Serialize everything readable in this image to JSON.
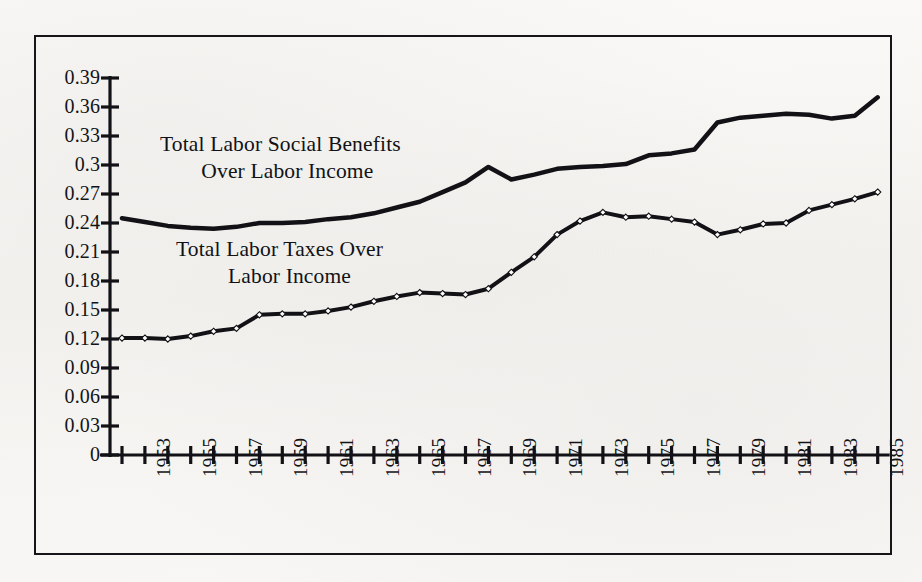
{
  "figure": {
    "background_color": "#faf9f7",
    "border_color": "#16161a",
    "ink_color": "#121216"
  },
  "annotations": {
    "benefits": {
      "line1": "Total Labor Social Benefits",
      "line2": "Over Labor Income"
    },
    "taxes": {
      "line1": "Total Labor Taxes Over",
      "line2": "Labor Income"
    }
  },
  "chart_data": {
    "type": "line",
    "title": "",
    "subtitle": "",
    "xlabel": "",
    "ylabel": "",
    "xlim": [
      1952,
      1986
    ],
    "ylim": [
      0,
      0.39
    ],
    "grid": false,
    "legend_position": "inline-annotation",
    "ytick_labels": [
      "0.39",
      "0.36",
      "0.33",
      "0.3",
      "0.27",
      "0.24",
      "0.21",
      "0.18",
      "0.15",
      "0.12",
      "0.09",
      "0.06",
      "0.03",
      "0"
    ],
    "ytick_values": [
      0.39,
      0.36,
      0.33,
      0.3,
      0.27,
      0.24,
      0.21,
      0.18,
      0.15,
      0.12,
      0.09,
      0.06,
      0.03,
      0
    ],
    "xtick_values": [
      1952,
      1953,
      1954,
      1955,
      1956,
      1957,
      1958,
      1959,
      1960,
      1961,
      1962,
      1963,
      1964,
      1965,
      1966,
      1967,
      1968,
      1969,
      1970,
      1971,
      1972,
      1973,
      1974,
      1975,
      1976,
      1977,
      1978,
      1979,
      1980,
      1981,
      1982,
      1983,
      1984,
      1985
    ],
    "xtick_labels": [
      "",
      "1953",
      "",
      "1955",
      "",
      "1957",
      "",
      "1959",
      "",
      "1961",
      "",
      "1963",
      "",
      "1965",
      "",
      "1967",
      "",
      "1969",
      "",
      "1971",
      "",
      "1973",
      "",
      "1975",
      "",
      "1977",
      "",
      "1979",
      "",
      "1981",
      "",
      "1983",
      "",
      "1985"
    ],
    "x": [
      1952,
      1953,
      1954,
      1955,
      1956,
      1957,
      1958,
      1959,
      1960,
      1961,
      1962,
      1963,
      1964,
      1965,
      1966,
      1967,
      1968,
      1969,
      1970,
      1971,
      1972,
      1973,
      1974,
      1975,
      1976,
      1977,
      1978,
      1979,
      1980,
      1981,
      1982,
      1983,
      1984,
      1985
    ],
    "series": [
      {
        "name": "Total Labor Social Benefits Over Labor Income",
        "marker": "none",
        "line_width": 4.5,
        "color": "#121216",
        "values": [
          0.245,
          0.241,
          0.237,
          0.235,
          0.234,
          0.236,
          0.24,
          0.24,
          0.241,
          0.244,
          0.246,
          0.25,
          0.256,
          0.262,
          0.272,
          0.282,
          0.298,
          0.285,
          0.29,
          0.296,
          0.298,
          0.299,
          0.301,
          0.31,
          0.312,
          0.316,
          0.344,
          0.349,
          0.351,
          0.353,
          0.352,
          0.348,
          0.351,
          0.37
        ]
      },
      {
        "name": "Total Labor Taxes Over Labor Income",
        "marker": "diamond-open",
        "line_width": 4.0,
        "color": "#121216",
        "values": [
          0.121,
          0.121,
          0.12,
          0.123,
          0.128,
          0.131,
          0.145,
          0.146,
          0.146,
          0.149,
          0.153,
          0.159,
          0.164,
          0.168,
          0.167,
          0.166,
          0.172,
          0.189,
          0.205,
          0.228,
          0.242,
          0.251,
          0.246,
          0.247,
          0.244,
          0.241,
          0.228,
          0.233,
          0.239,
          0.24,
          0.253,
          0.259,
          0.265,
          0.272
        ]
      }
    ]
  }
}
